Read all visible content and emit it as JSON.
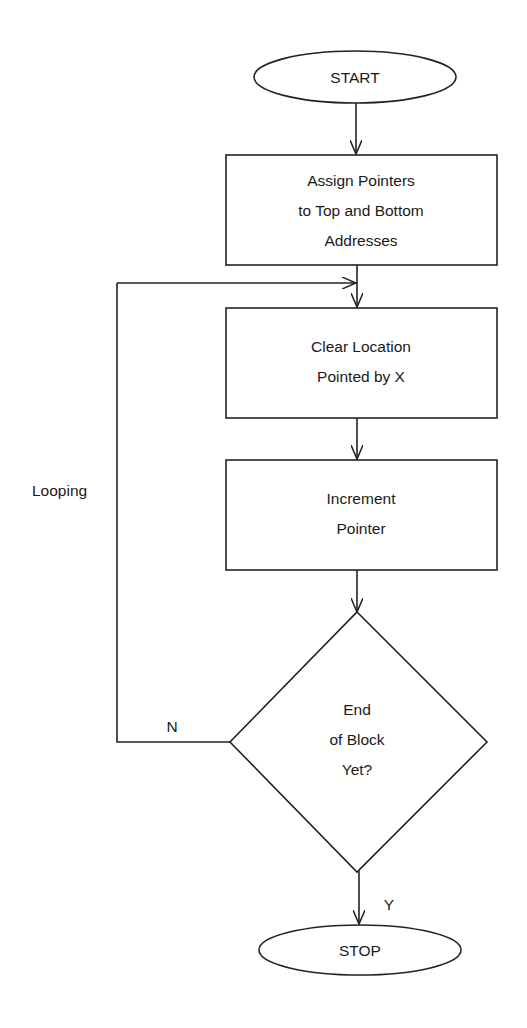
{
  "diagram": {
    "type": "flowchart",
    "colors": {
      "stroke": "#222222",
      "background": "#ffffff",
      "text": "#1a1a1a"
    },
    "nodes": {
      "start": {
        "shape": "ellipse",
        "label": "START"
      },
      "assign": {
        "shape": "rect",
        "lines": [
          "Assign Pointers",
          "to Top and Bottom",
          "Addresses"
        ]
      },
      "clear": {
        "shape": "rect",
        "lines": [
          "Clear Location",
          "Pointed by X"
        ]
      },
      "increment": {
        "shape": "rect",
        "lines": [
          "Increment",
          "Pointer"
        ]
      },
      "decision": {
        "shape": "diamond",
        "lines": [
          "End",
          "of Block",
          "Yet?"
        ]
      },
      "stop": {
        "shape": "ellipse",
        "label": "STOP"
      }
    },
    "edges": [
      {
        "from": "start",
        "to": "assign",
        "label": ""
      },
      {
        "from": "assign",
        "to": "clear",
        "label": ""
      },
      {
        "from": "clear",
        "to": "increment",
        "label": ""
      },
      {
        "from": "increment",
        "to": "decision",
        "label": ""
      },
      {
        "from": "decision",
        "to": "clear",
        "label": "N"
      },
      {
        "from": "decision",
        "to": "stop",
        "label": "Y"
      }
    ],
    "annotations": {
      "loop_label": "Looping",
      "no_label": "N",
      "yes_label": "Y"
    }
  }
}
